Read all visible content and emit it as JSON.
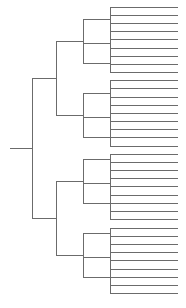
{
  "figure": {
    "type": "dendrogram",
    "orientation": "left-to-right",
    "style": "rectangular",
    "background_color": "#ffffff",
    "line_color": "#6b6b6b",
    "line_width": 1,
    "width": 186,
    "height": 308,
    "leaf_count": 36,
    "has_labels": false,
    "has_axis": false,
    "has_scale_bar": false
  },
  "chart_data": {
    "type": "dendrogram",
    "title": "",
    "xlabel": "",
    "ylabel": "",
    "orientation": "left-to-right",
    "leaf_count": 36,
    "leaf_tip_x": 178,
    "leaf_spacing": 8.22,
    "first_leaf_y": 7,
    "depth_levels": [
      10,
      32,
      56,
      83,
      110
    ],
    "root": {
      "id": "root",
      "x": 32,
      "y": 148,
      "stub_x": 10,
      "children": [
        "cladeA",
        "cladeB"
      ]
    },
    "internal_nodes": [
      {
        "id": "root",
        "x": 32,
        "y": 148,
        "y_top": 78,
        "y_bottom": 218,
        "children": [
          "cladeA",
          "cladeB"
        ]
      },
      {
        "id": "cladeA",
        "x": 56,
        "y": 78,
        "y_top": 41,
        "y_bottom": 115,
        "children": [
          "groupA1",
          "groupA2"
        ]
      },
      {
        "id": "cladeB",
        "x": 56,
        "y": 218,
        "y_top": 181,
        "y_bottom": 255,
        "children": [
          "groupB1",
          "groupB2"
        ]
      },
      {
        "id": "groupA1",
        "x": 83,
        "y": 41,
        "y_top": 19,
        "y_bottom": 63,
        "children": [
          "cherry1",
          "cherry2",
          "cherry3"
        ]
      },
      {
        "id": "groupA2",
        "x": 83,
        "y": 115,
        "y_top": 93,
        "y_bottom": 137,
        "children": [
          "cherry4",
          "cherry5",
          "cherry6"
        ]
      },
      {
        "id": "groupB1",
        "x": 83,
        "y": 181,
        "y_top": 159,
        "y_bottom": 203,
        "children": [
          "cherry7",
          "cherry8",
          "cherry9"
        ]
      },
      {
        "id": "groupB2",
        "x": 83,
        "y": 255,
        "y_top": 233,
        "y_bottom": 277,
        "children": [
          "cherry10",
          "cherry11",
          "cherry12"
        ]
      },
      {
        "id": "cherry1",
        "x": 110,
        "y": 19,
        "y_top": 7,
        "y_bottom": 31,
        "leaves": [
          0,
          1,
          2
        ]
      },
      {
        "id": "cherry2",
        "x": 110,
        "y": 43,
        "y_top": 31,
        "y_bottom": 56,
        "leaves": [
          3,
          4,
          5
        ]
      },
      {
        "id": "cherry3",
        "x": 110,
        "y": 63,
        "y_top": 56,
        "y_bottom": 72,
        "leaves": [
          6,
          7,
          8
        ]
      },
      {
        "id": "cherry4",
        "x": 110,
        "y": 93,
        "y_top": 80,
        "y_bottom": 105,
        "leaves": [
          9,
          10,
          11
        ]
      },
      {
        "id": "cherry5",
        "x": 110,
        "y": 117,
        "y_top": 105,
        "y_bottom": 129,
        "leaves": [
          12,
          13,
          14
        ]
      },
      {
        "id": "cherry6",
        "x": 110,
        "y": 137,
        "y_top": 129,
        "y_bottom": 146,
        "leaves": [
          15,
          16,
          17
        ]
      },
      {
        "id": "cherry7",
        "x": 110,
        "y": 159,
        "y_top": 154,
        "y_bottom": 170,
        "leaves": [
          18,
          19,
          20
        ]
      },
      {
        "id": "cherry8",
        "x": 110,
        "y": 183,
        "y_top": 170,
        "y_bottom": 195,
        "leaves": [
          21,
          22,
          23
        ]
      },
      {
        "id": "cherry9",
        "x": 110,
        "y": 203,
        "y_top": 195,
        "y_bottom": 219,
        "leaves": [
          24,
          25,
          26
        ]
      },
      {
        "id": "cherry10",
        "x": 110,
        "y": 233,
        "y_top": 228,
        "y_bottom": 244,
        "leaves": [
          27,
          28,
          29
        ]
      },
      {
        "id": "cherry11",
        "x": 110,
        "y": 257,
        "y_top": 244,
        "y_bottom": 269,
        "leaves": [
          30,
          31,
          32
        ]
      },
      {
        "id": "cherry12",
        "x": 110,
        "y": 277,
        "y_top": 269,
        "y_bottom": 293,
        "leaves": [
          33,
          34,
          35
        ]
      }
    ],
    "leaves": [
      {
        "index": 0,
        "y": 7,
        "branch_x": 110
      },
      {
        "index": 1,
        "y": 15,
        "branch_x": 110
      },
      {
        "index": 2,
        "y": 23,
        "branch_x": 110
      },
      {
        "index": 3,
        "y": 31,
        "branch_x": 110
      },
      {
        "index": 4,
        "y": 39,
        "branch_x": 110
      },
      {
        "index": 5,
        "y": 48,
        "branch_x": 110
      },
      {
        "index": 6,
        "y": 56,
        "branch_x": 110
      },
      {
        "index": 7,
        "y": 64,
        "branch_x": 110
      },
      {
        "index": 8,
        "y": 72,
        "branch_x": 110
      },
      {
        "index": 9,
        "y": 80,
        "branch_x": 110
      },
      {
        "index": 10,
        "y": 88,
        "branch_x": 110
      },
      {
        "index": 11,
        "y": 97,
        "branch_x": 110
      },
      {
        "index": 12,
        "y": 105,
        "branch_x": 110
      },
      {
        "index": 13,
        "y": 113,
        "branch_x": 110
      },
      {
        "index": 14,
        "y": 121,
        "branch_x": 110
      },
      {
        "index": 15,
        "y": 129,
        "branch_x": 110
      },
      {
        "index": 16,
        "y": 137,
        "branch_x": 110
      },
      {
        "index": 17,
        "y": 146,
        "branch_x": 110
      },
      {
        "index": 18,
        "y": 154,
        "branch_x": 110
      },
      {
        "index": 19,
        "y": 162,
        "branch_x": 110
      },
      {
        "index": 20,
        "y": 170,
        "branch_x": 110
      },
      {
        "index": 21,
        "y": 178,
        "branch_x": 110
      },
      {
        "index": 22,
        "y": 186,
        "branch_x": 110
      },
      {
        "index": 23,
        "y": 195,
        "branch_x": 110
      },
      {
        "index": 24,
        "y": 203,
        "branch_x": 110
      },
      {
        "index": 25,
        "y": 211,
        "branch_x": 110
      },
      {
        "index": 26,
        "y": 219,
        "branch_x": 110
      },
      {
        "index": 27,
        "y": 228,
        "branch_x": 110
      },
      {
        "index": 28,
        "y": 236,
        "branch_x": 110
      },
      {
        "index": 29,
        "y": 244,
        "branch_x": 110
      },
      {
        "index": 30,
        "y": 252,
        "branch_x": 110
      },
      {
        "index": 31,
        "y": 260,
        "branch_x": 110
      },
      {
        "index": 32,
        "y": 269,
        "branch_x": 110
      },
      {
        "index": 33,
        "y": 277,
        "branch_x": 110
      },
      {
        "index": 34,
        "y": 285,
        "branch_x": 110
      },
      {
        "index": 35,
        "y": 293,
        "branch_x": 110
      }
    ]
  }
}
